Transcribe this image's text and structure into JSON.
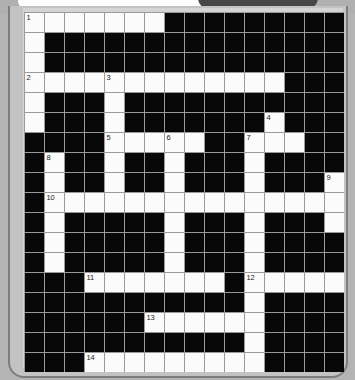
{
  "window": {
    "title": "Crossword Puzzle Grid",
    "tab_light_label": "",
    "tab_dark_label": ""
  },
  "puzzle": {
    "name": "crossword-grid",
    "rows": 18,
    "cols": 16,
    "cell_size_px": 19,
    "colors": {
      "white_cell": "#fbfbfb",
      "black_cell": "#080808",
      "grid_line": "#9a9a9a",
      "page_background": "#b4b4b4",
      "frame_background": "#d4d4d4",
      "frame_border": "#7d7d7d",
      "tab_light": "#fdfdfd",
      "tab_dark": "#474747",
      "number_text": "#222222"
    },
    "clue_numbers": [
      {
        "number": "1",
        "row": 0,
        "col": 0
      },
      {
        "number": "2",
        "row": 3,
        "col": 0
      },
      {
        "number": "3",
        "row": 3,
        "col": 4
      },
      {
        "number": "4",
        "row": 5,
        "col": 12
      },
      {
        "number": "5",
        "row": 6,
        "col": 4
      },
      {
        "number": "6",
        "row": 6,
        "col": 7
      },
      {
        "number": "7",
        "row": 6,
        "col": 11
      },
      {
        "number": "8",
        "row": 7,
        "col": 1
      },
      {
        "number": "9",
        "row": 8,
        "col": 15
      },
      {
        "number": "10",
        "row": 9,
        "col": 1
      },
      {
        "number": "11",
        "row": 13,
        "col": 3
      },
      {
        "number": "12",
        "row": 13,
        "col": 11
      },
      {
        "number": "13",
        "row": 15,
        "col": 6
      },
      {
        "number": "14",
        "row": 17,
        "col": 3
      }
    ],
    "grid": [
      [
        "W",
        "W",
        "W",
        "W",
        "W",
        "W",
        "W",
        "B",
        "B",
        "B",
        "B",
        "B",
        "B",
        "B",
        "B",
        "B"
      ],
      [
        "W",
        "B",
        "B",
        "B",
        "B",
        "B",
        "B",
        "B",
        "B",
        "B",
        "B",
        "B",
        "B",
        "B",
        "B",
        "B"
      ],
      [
        "W",
        "B",
        "B",
        "B",
        "B",
        "B",
        "B",
        "B",
        "B",
        "B",
        "B",
        "B",
        "B",
        "B",
        "B",
        "B"
      ],
      [
        "W",
        "W",
        "W",
        "W",
        "W",
        "W",
        "W",
        "W",
        "W",
        "W",
        "W",
        "W",
        "W",
        "B",
        "B",
        "B"
      ],
      [
        "W",
        "B",
        "B",
        "B",
        "W",
        "B",
        "B",
        "B",
        "B",
        "B",
        "B",
        "B",
        "B",
        "B",
        "B",
        "B"
      ],
      [
        "W",
        "B",
        "B",
        "B",
        "W",
        "B",
        "B",
        "B",
        "B",
        "B",
        "B",
        "B",
        "W",
        "B",
        "B",
        "B"
      ],
      [
        "B",
        "B",
        "B",
        "B",
        "W",
        "W",
        "W",
        "W",
        "W",
        "B",
        "B",
        "W",
        "W",
        "W",
        "B",
        "B"
      ],
      [
        "B",
        "W",
        "B",
        "B",
        "W",
        "B",
        "B",
        "W",
        "B",
        "B",
        "B",
        "W",
        "B",
        "B",
        "B",
        "B"
      ],
      [
        "B",
        "W",
        "B",
        "B",
        "W",
        "B",
        "B",
        "W",
        "B",
        "B",
        "B",
        "W",
        "B",
        "B",
        "B",
        "W"
      ],
      [
        "B",
        "W",
        "W",
        "W",
        "W",
        "W",
        "W",
        "W",
        "W",
        "W",
        "W",
        "W",
        "W",
        "W",
        "W",
        "W"
      ],
      [
        "B",
        "W",
        "B",
        "B",
        "B",
        "B",
        "B",
        "W",
        "B",
        "B",
        "B",
        "W",
        "B",
        "B",
        "B",
        "W"
      ],
      [
        "B",
        "W",
        "B",
        "B",
        "B",
        "B",
        "B",
        "W",
        "B",
        "B",
        "B",
        "W",
        "B",
        "B",
        "B",
        "B"
      ],
      [
        "B",
        "W",
        "B",
        "B",
        "B",
        "B",
        "B",
        "W",
        "B",
        "B",
        "B",
        "W",
        "B",
        "B",
        "B",
        "B"
      ],
      [
        "B",
        "B",
        "B",
        "W",
        "W",
        "W",
        "W",
        "W",
        "W",
        "W",
        "B",
        "W",
        "W",
        "W",
        "W",
        "W"
      ],
      [
        "B",
        "B",
        "B",
        "B",
        "B",
        "B",
        "B",
        "B",
        "B",
        "B",
        "B",
        "W",
        "B",
        "B",
        "B",
        "B"
      ],
      [
        "B",
        "B",
        "B",
        "B",
        "B",
        "B",
        "W",
        "W",
        "W",
        "W",
        "W",
        "W",
        "B",
        "B",
        "B",
        "B"
      ],
      [
        "B",
        "B",
        "B",
        "B",
        "B",
        "B",
        "B",
        "B",
        "B",
        "B",
        "B",
        "W",
        "B",
        "B",
        "B",
        "B"
      ],
      [
        "B",
        "B",
        "B",
        "W",
        "W",
        "W",
        "W",
        "W",
        "W",
        "W",
        "W",
        "W",
        "B",
        "B",
        "B",
        "B"
      ]
    ]
  }
}
